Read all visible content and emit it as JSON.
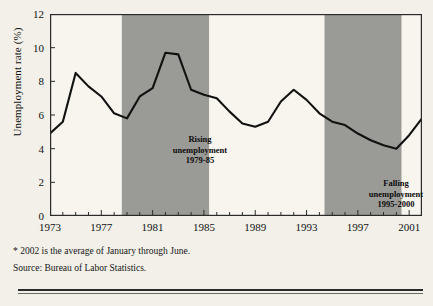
{
  "chart_data": {
    "type": "line",
    "title": "",
    "xlabel": "",
    "ylabel": "Unemployment rate (%)",
    "ylim": [
      0,
      12
    ],
    "yticks": [
      0,
      2,
      4,
      6,
      8,
      10,
      12
    ],
    "ytick_labels": [
      "0",
      "2",
      "4",
      "6",
      "8",
      "10",
      "12"
    ],
    "xlim": [
      1973,
      2002
    ],
    "xticks": [
      1973,
      1977,
      1981,
      1985,
      1989,
      1993,
      1997,
      2001
    ],
    "xtick_labels": [
      "1973",
      "1977",
      "1981",
      "1985",
      "1989",
      "1993",
      "1997",
      "2001"
    ],
    "x_minor_ticks_every": 1,
    "grid": false,
    "legend": "none",
    "line_color": "#111111",
    "line_width": 2.1,
    "plot_background": "#f7f5ee",
    "band_color": "#9a9a96",
    "border_color": "#2b2b2b",
    "x": [
      1973,
      1974,
      1975,
      1976,
      1977,
      1978,
      1979,
      1980,
      1981,
      1982,
      1983,
      1984,
      1985,
      1986,
      1987,
      1988,
      1989,
      1990,
      1991,
      1992,
      1993,
      1994,
      1995,
      1996,
      1997,
      1998,
      1999,
      2000,
      2001,
      2002
    ],
    "values": [
      4.9,
      5.6,
      8.5,
      7.7,
      7.1,
      6.1,
      5.8,
      7.1,
      7.6,
      9.7,
      9.6,
      7.5,
      7.2,
      7.0,
      6.2,
      5.5,
      5.3,
      5.6,
      6.8,
      7.5,
      6.9,
      6.1,
      5.6,
      5.4,
      4.9,
      4.5,
      4.2,
      4.0,
      4.8,
      5.8
    ],
    "series": [
      {
        "name": "Unemployment rate",
        "values": [
          4.9,
          5.6,
          8.5,
          7.7,
          7.1,
          6.1,
          5.8,
          7.1,
          7.6,
          9.7,
          9.6,
          7.5,
          7.2,
          7.0,
          6.2,
          5.5,
          5.3,
          5.6,
          6.8,
          7.5,
          6.9,
          6.1,
          5.6,
          5.4,
          4.9,
          4.5,
          4.2,
          4.0,
          4.8,
          5.8
        ]
      }
    ],
    "bands": [
      {
        "name": "rising-unemployment-band",
        "x_start": 1978.6,
        "x_end": 1985.4,
        "label_lines": [
          "Rising",
          "unemployment",
          "1979-85"
        ]
      },
      {
        "name": "falling-unemployment-band",
        "x_start": 1994.4,
        "x_end": 2000.4,
        "label_lines": [
          "Falling",
          "unemployment",
          "1995-2000"
        ]
      }
    ],
    "annotations": [
      "* 2002 is the average of January through June.",
      "Source: Bureau of Labor Statistics."
    ]
  },
  "notes": {
    "footnote": "* 2002 is the average of January through June.",
    "source": "Source: Bureau of Labor Statistics."
  },
  "bands": {
    "rising": {
      "line1": "Rising",
      "line2": "unemployment",
      "line3": "1979-85"
    },
    "falling": {
      "line1": "Falling",
      "line2": "unemployment",
      "line3": "1995-2000"
    }
  },
  "axes": {
    "y_title": "Unemployment rate (%)"
  }
}
